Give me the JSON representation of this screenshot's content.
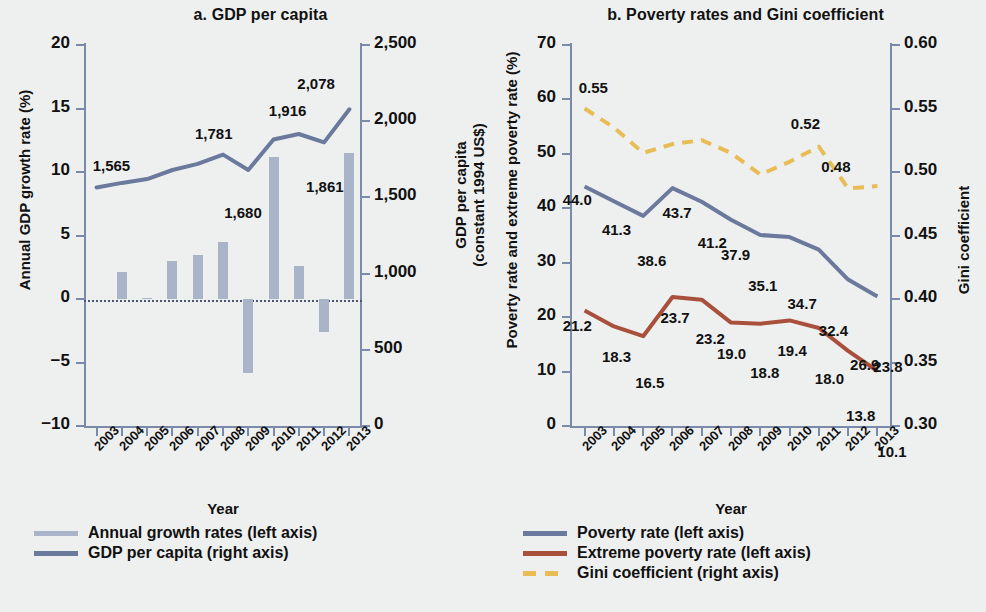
{
  "colors": {
    "bar": "#aab4c8",
    "gdp_line": "#6b7a9c",
    "poverty_line": "#6b7a9c",
    "extreme_line": "#a8503c",
    "gini_line": "#e8bd55",
    "axis": "#7b8aa8",
    "background": "#eef0f0"
  },
  "panel_a": {
    "title": "a. GDP per capita",
    "ylabel_left": "Annual GDP growth rate (%)",
    "ylabel_right": "GDP per capita\n(constant 1994 US$)",
    "ylabel_right_line1": "GDP per capita",
    "ylabel_right_line2": "(constant 1994 US$)",
    "xlabel": "Year",
    "yticks_left": [
      "20",
      "15",
      "10",
      "5",
      "0",
      "−5",
      "−10"
    ],
    "yticks_right": [
      "2,500",
      "2,000",
      "1,500",
      "1,000",
      "500",
      "0"
    ],
    "xticks": [
      "2003",
      "2004",
      "2005",
      "2006",
      "2007",
      "2008",
      "2009",
      "2010",
      "2011",
      "2012",
      "2013"
    ],
    "legend": [
      {
        "label": "Annual growth rates (left axis)",
        "type": "solid",
        "color": "#aab4c8"
      },
      {
        "label": "GDP per capita (right axis)",
        "type": "solid",
        "color": "#6b7a9c"
      }
    ]
  },
  "panel_b": {
    "title": "b. Poverty rates and Gini coefficient",
    "ylabel_left": "Poverty rate and extreme poverty rate (%)",
    "ylabel_right": "Gini coefficient",
    "xlabel": "Year",
    "yticks_left": [
      "70",
      "60",
      "50",
      "40",
      "30",
      "20",
      "10",
      "0"
    ],
    "yticks_right": [
      "0.60",
      "0.55",
      "0.50",
      "0.45",
      "0.40",
      "0.35",
      "0.30"
    ],
    "xticks": [
      "2003",
      "2004",
      "2005",
      "2006",
      "2007",
      "2008",
      "2009",
      "2010",
      "2011",
      "2012",
      "2013"
    ],
    "legend": [
      {
        "label": "Poverty rate (left axis)",
        "type": "solid",
        "color": "#6b7a9c"
      },
      {
        "label": "Extreme poverty rate (left axis)",
        "type": "solid",
        "color": "#a8503c"
      },
      {
        "label": "Gini coefficient (right axis)",
        "type": "dashed",
        "color": "#e8bd55"
      }
    ]
  },
  "chart_data": [
    {
      "type": "bar",
      "id": "panel-a",
      "title": "a. GDP per capita",
      "xlabel": "Year",
      "ylabel": "Annual GDP growth rate (%)",
      "ylabel_secondary": "GDP per capita (constant 1994 US$)",
      "categories": [
        "2003",
        "2004",
        "2005",
        "2006",
        "2007",
        "2008",
        "2009",
        "2010",
        "2011",
        "2012",
        "2013"
      ],
      "ylim": [
        -10,
        20
      ],
      "ylim_secondary": [
        0,
        2500
      ],
      "grid": false,
      "legend_position": "below",
      "series": [
        {
          "name": "Annual growth rates (left axis)",
          "type": "bar",
          "axis": "left",
          "color": "#aab4c8",
          "values": [
            0.0,
            2.1,
            0.1,
            3.0,
            3.5,
            4.5,
            -5.8,
            11.2,
            2.6,
            -2.6,
            11.5
          ]
        },
        {
          "name": "GDP per capita (right axis)",
          "type": "line",
          "axis": "right",
          "color": "#6b7a9c",
          "values": [
            1565,
            1595,
            1620,
            1680,
            1720,
            1781,
            1680,
            1880,
            1916,
            1861,
            2078
          ],
          "point_labels": {
            "2003": "1,565",
            "2008": "1,781",
            "2009": "1,680",
            "2011": "1,916",
            "2012": "1,861",
            "2013": "2,078"
          }
        }
      ],
      "annotations": [
        "1,565",
        "1,781",
        "1,680",
        "1,916",
        "1,861",
        "2,078"
      ]
    },
    {
      "type": "line",
      "id": "panel-b",
      "title": "b. Poverty rates and Gini coefficient",
      "xlabel": "Year",
      "ylabel": "Poverty rate and extreme poverty rate (%)",
      "ylabel_secondary": "Gini coefficient",
      "categories": [
        "2003",
        "2004",
        "2005",
        "2006",
        "2007",
        "2008",
        "2009",
        "2010",
        "2011",
        "2012",
        "2013"
      ],
      "ylim": [
        0,
        70
      ],
      "ylim_secondary": [
        0.3,
        0.6
      ],
      "grid": false,
      "legend_position": "below",
      "series": [
        {
          "name": "Poverty rate (left axis)",
          "type": "line",
          "axis": "left",
          "color": "#6b7a9c",
          "values": [
            44.0,
            41.3,
            38.6,
            43.7,
            41.2,
            37.9,
            35.1,
            34.7,
            32.4,
            26.9,
            23.8
          ],
          "labels": [
            "44.0",
            "41.3",
            "38.6",
            "43.7",
            "41.2",
            "37.9",
            "35.1",
            "34.7",
            "32.4",
            "26.9",
            "23.8"
          ]
        },
        {
          "name": "Extreme poverty rate (left axis)",
          "type": "line",
          "axis": "left",
          "color": "#a8503c",
          "values": [
            21.2,
            18.3,
            16.5,
            23.7,
            23.2,
            19.0,
            18.8,
            19.4,
            18.0,
            13.8,
            10.1
          ],
          "labels": [
            "21.2",
            "18.3",
            "16.5",
            "23.7",
            "23.2",
            "19.0",
            "18.8",
            "19.4",
            "18.0",
            "13.8",
            "10.1"
          ]
        },
        {
          "name": "Gini coefficient (right axis)",
          "type": "line",
          "style": "dashed",
          "axis": "right",
          "color": "#e8bd55",
          "values": [
            0.55,
            0.535,
            0.515,
            0.522,
            0.525,
            0.515,
            0.498,
            0.508,
            0.52,
            0.487,
            0.489
          ],
          "labels": [
            "0.55",
            null,
            null,
            null,
            null,
            null,
            null,
            null,
            "0.52",
            null,
            "0.48"
          ]
        }
      ],
      "annotations": [
        "0.55",
        "0.52",
        "0.48"
      ]
    }
  ]
}
